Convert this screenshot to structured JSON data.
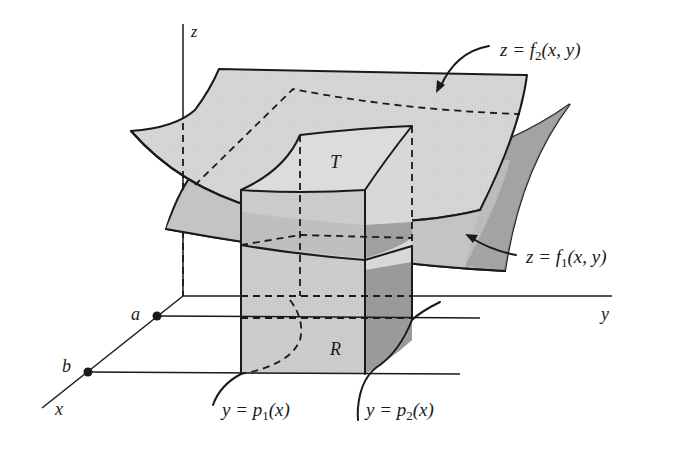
{
  "figure": {
    "colors": {
      "line": "#1a1a1a",
      "surface_upper": "#d9d9d9",
      "surface_lower": "#bdbdbd",
      "side_light": "#cfcfcf",
      "side_dark": "#9a9a9a",
      "background": "#ffffff"
    }
  },
  "axes": {
    "x_label": "x",
    "y_label": "y",
    "z_label": "z"
  },
  "points": {
    "a_label": "a",
    "b_label": "b"
  },
  "regions": {
    "solid_label": "T",
    "base_label": "R"
  },
  "annotations": {
    "upper_surface": {
      "prefix": "z = f",
      "sub": "2",
      "suffix": "(x, y)"
    },
    "lower_surface": {
      "prefix": "z = f",
      "sub": "1",
      "suffix": "(x, y)"
    },
    "curve1": {
      "prefix": "y = p",
      "sub": "1",
      "suffix": "(x)"
    },
    "curve2": {
      "prefix": "y = p",
      "sub": "2",
      "suffix": "(x)"
    }
  }
}
